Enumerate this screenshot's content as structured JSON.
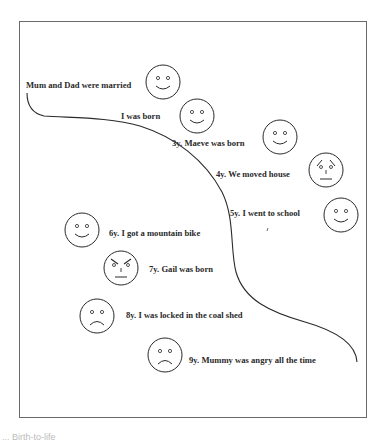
{
  "diagram": {
    "type": "lifeline",
    "start_label": "Mum and Dad were married",
    "events": [
      {
        "label": "I was born",
        "mood": "happy"
      },
      {
        "label": "3y. Maeve was born",
        "mood": "happy"
      },
      {
        "label": "4y. We moved house",
        "mood": "worried"
      },
      {
        "label": "5y. I went to school",
        "mood": "happy"
      },
      {
        "label": "6y. I got a mountain bike",
        "mood": "happy"
      },
      {
        "label": "7y. Gail was born",
        "mood": "angry"
      },
      {
        "label": "8y. I was locked in the coal shed",
        "mood": "sad"
      },
      {
        "label": "9y. Mummy was angry all the time",
        "mood": "sad"
      }
    ],
    "faces": [
      {
        "mood": "happy",
        "near": "Mum and Dad were married"
      },
      {
        "mood": "happy",
        "near": "I was born"
      },
      {
        "mood": "happy",
        "near": "3y. Maeve was born"
      },
      {
        "mood": "worried",
        "near": "4y. We moved house"
      },
      {
        "mood": "happy",
        "near": "5y. I went to school"
      },
      {
        "mood": "happy",
        "near": "6y. I got a mountain bike"
      },
      {
        "mood": "angry",
        "near": "7y. Gail was born"
      },
      {
        "mood": "sad",
        "near": "8y. I was locked in the coal shed"
      },
      {
        "mood": "sad",
        "near": "9y. Mummy was angry all the time"
      }
    ],
    "stroke_color": "#2a2a2a",
    "frame_color": "#6a6a6a"
  },
  "caption": "... Birth-to-life"
}
